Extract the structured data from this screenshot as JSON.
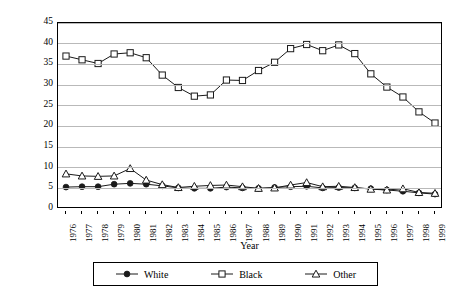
{
  "chart_data": {
    "type": "line",
    "title": "",
    "xlabel": "Year",
    "ylabel": "Murder Rate/100,000",
    "xlim": [
      1976,
      1999
    ],
    "ylim": [
      0,
      45
    ],
    "ytick_step": 5,
    "grid": true,
    "legend_position": "bottom",
    "categories": [
      1976,
      1977,
      1978,
      1979,
      1980,
      1981,
      1982,
      1983,
      1984,
      1985,
      1986,
      1987,
      1988,
      1989,
      1990,
      1991,
      1992,
      1993,
      1994,
      1995,
      1996,
      1997,
      1998,
      1999
    ],
    "xticklabels": [
      "1976",
      "1977",
      "1978",
      "1979",
      "1980",
      "1981",
      "1982",
      "1983",
      "1984",
      "1985",
      "1986",
      "1987",
      "1988",
      "1989",
      "1990",
      "1991",
      "1992",
      "1993",
      "1994",
      "1995",
      "1996",
      "1997",
      "1998",
      "1999"
    ],
    "yticklabels": [
      "0",
      "5",
      "10",
      "15",
      "20",
      "25",
      "30",
      "35",
      "40",
      "45"
    ],
    "series": [
      {
        "name": "White",
        "marker": "filled-circle",
        "color": "#1a1a1a",
        "values": [
          5.3,
          5.4,
          5.4,
          6.0,
          6.2,
          6.0,
          5.6,
          5.1,
          5.0,
          5.0,
          5.3,
          5.1,
          5.0,
          5.2,
          5.4,
          5.5,
          5.1,
          5.2,
          5.1,
          4.9,
          4.6,
          4.3,
          3.9,
          3.6
        ]
      },
      {
        "name": "Black",
        "marker": "open-square",
        "color": "#1a1a1a",
        "values": [
          37.0,
          36.1,
          35.2,
          37.5,
          37.8,
          36.6,
          32.4,
          29.4,
          27.3,
          27.6,
          31.2,
          31.1,
          33.5,
          35.5,
          38.8,
          39.8,
          38.3,
          39.7,
          37.6,
          32.7,
          29.5,
          27.1,
          23.5,
          20.8
        ]
      },
      {
        "name": "Other",
        "marker": "open-triangle",
        "color": "#1a1a1a",
        "values": [
          8.5,
          8.0,
          7.9,
          8.0,
          9.8,
          7.0,
          5.9,
          5.2,
          5.5,
          5.7,
          5.8,
          5.4,
          5.0,
          5.1,
          5.8,
          6.4,
          5.4,
          5.5,
          5.2,
          4.8,
          4.6,
          4.9,
          4.0,
          3.8
        ]
      }
    ]
  },
  "legend": {
    "items": [
      {
        "label": "White"
      },
      {
        "label": "Black"
      },
      {
        "label": "Other"
      }
    ]
  }
}
